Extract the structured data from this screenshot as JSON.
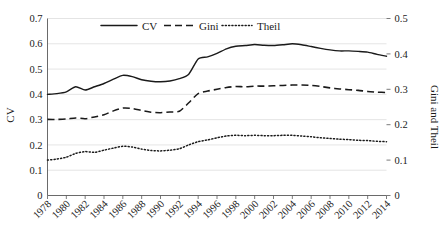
{
  "chart_data": {
    "type": "line",
    "title": "",
    "xlabel": "",
    "ylabel": "CV",
    "y2label": "Gini and Theil",
    "ylim": [
      0,
      0.7
    ],
    "y2lim": [
      0,
      0.5
    ],
    "grid": true,
    "legend_position": "top-center",
    "x": [
      1978,
      1979,
      1980,
      1981,
      1982,
      1983,
      1984,
      1985,
      1986,
      1987,
      1988,
      1989,
      1990,
      1991,
      1992,
      1993,
      1994,
      1995,
      1996,
      1997,
      1998,
      1999,
      2000,
      2001,
      2002,
      2003,
      2004,
      2005,
      2006,
      2007,
      2008,
      2009,
      2010,
      2011,
      2012,
      2013,
      2014
    ],
    "xticks": [
      "1978",
      "1980",
      "1982",
      "1984",
      "1986",
      "1988",
      "1990",
      "1992",
      "1994",
      "1996",
      "1998",
      "2000",
      "2002",
      "2004",
      "2006",
      "2008",
      "2010",
      "2012",
      "2014"
    ],
    "yticks": [
      "0",
      "0.1",
      "0.2",
      "0.3",
      "0.4",
      "0.5",
      "0.6",
      "0.7"
    ],
    "y2ticks": [
      "0",
      "0.1",
      "0.2",
      "0.3",
      "0.4",
      "0.5"
    ],
    "series": [
      {
        "name": "CV",
        "axis": "left",
        "style": "solid",
        "color": "#1a1a1a",
        "values": [
          0.4,
          0.403,
          0.41,
          0.43,
          0.417,
          0.43,
          0.443,
          0.46,
          0.475,
          0.47,
          0.458,
          0.452,
          0.45,
          0.453,
          0.462,
          0.48,
          0.54,
          0.548,
          0.562,
          0.58,
          0.59,
          0.593,
          0.597,
          0.594,
          0.593,
          0.596,
          0.6,
          0.596,
          0.589,
          0.582,
          0.576,
          0.572,
          0.572,
          0.57,
          0.567,
          0.558,
          0.551
        ]
      },
      {
        "name": "Gini",
        "axis": "right",
        "style": "dashed",
        "color": "#1a1a1a",
        "values": [
          0.215,
          0.215,
          0.216,
          0.219,
          0.217,
          0.222,
          0.228,
          0.239,
          0.247,
          0.246,
          0.24,
          0.235,
          0.234,
          0.236,
          0.238,
          0.262,
          0.288,
          0.295,
          0.3,
          0.305,
          0.308,
          0.307,
          0.309,
          0.309,
          0.31,
          0.311,
          0.312,
          0.312,
          0.311,
          0.308,
          0.304,
          0.301,
          0.299,
          0.297,
          0.294,
          0.292,
          0.291
        ]
      },
      {
        "name": "Theil",
        "axis": "right",
        "style": "dotted",
        "color": "#1a1a1a",
        "values": [
          0.1,
          0.103,
          0.108,
          0.119,
          0.124,
          0.122,
          0.128,
          0.134,
          0.139,
          0.137,
          0.131,
          0.127,
          0.126,
          0.128,
          0.132,
          0.143,
          0.152,
          0.157,
          0.163,
          0.168,
          0.17,
          0.169,
          0.17,
          0.169,
          0.169,
          0.17,
          0.17,
          0.168,
          0.166,
          0.163,
          0.161,
          0.159,
          0.158,
          0.156,
          0.155,
          0.153,
          0.152
        ]
      }
    ],
    "legend": [
      "CV",
      "Gini",
      "Theil"
    ]
  }
}
